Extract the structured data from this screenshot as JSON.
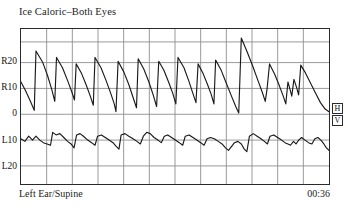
{
  "chart_title": "Ice Caloric–Both Eyes",
  "footer": {
    "condition_label": "Left Ear/Supine",
    "elapsed_time": "00:36"
  },
  "channels": {
    "horizontal_label": "H",
    "vertical_label": "V"
  },
  "colors": {
    "frame": "#2a2a2a",
    "grid": "#8d8d8d",
    "trace": "#1a1a1a",
    "background": "#ffffff"
  },
  "chart_data": {
    "type": "line",
    "title": "Ice Caloric–Both Eyes",
    "subtitle": "Left Ear/Supine",
    "xlabel": "",
    "ylabel": "Eye position (degrees)",
    "annotations": [
      "Left Ear/Supine",
      "00:36"
    ],
    "grid": true,
    "legend_position": "right-inline",
    "x": {
      "unit": "seconds",
      "range": [
        0,
        36
      ],
      "tick_count": 12,
      "tick_labels": []
    },
    "y": {
      "unit": "degrees",
      "axis_range": [
        -27,
        33
      ],
      "tick_values": [
        20,
        10,
        0,
        -10,
        -20
      ],
      "tick_labels": [
        "R20",
        "R10",
        "0",
        "L10",
        "L20"
      ],
      "direction_note": "Positive = Right, Negative = Left"
    },
    "series": [
      {
        "name": "H",
        "label": "Horizontal eye position",
        "description": "Right-beating sawtooth nystagmus; slow leftward drift with fast rightward saccade resets",
        "points": [
          [
            0.0,
            12.5
          ],
          [
            0.55,
            9.0
          ],
          [
            1.1,
            5.0
          ],
          [
            1.55,
            1.5
          ],
          [
            1.75,
            24.5
          ],
          [
            2.55,
            20.0
          ],
          [
            3.1,
            15.0
          ],
          [
            3.6,
            9.5
          ],
          [
            3.95,
            5.0
          ],
          [
            4.15,
            22.0
          ],
          [
            4.85,
            18.0
          ],
          [
            5.45,
            13.0
          ],
          [
            5.95,
            8.5
          ],
          [
            6.25,
            5.5
          ],
          [
            6.45,
            19.5
          ],
          [
            7.05,
            16.0
          ],
          [
            7.6,
            11.5
          ],
          [
            8.1,
            7.0
          ],
          [
            8.45,
            3.5
          ],
          [
            8.65,
            22.0
          ],
          [
            9.35,
            18.0
          ],
          [
            9.95,
            13.0
          ],
          [
            10.5,
            8.0
          ],
          [
            10.9,
            4.0
          ],
          [
            11.1,
            1.0
          ],
          [
            11.35,
            20.5
          ],
          [
            12.0,
            16.5
          ],
          [
            12.6,
            11.5
          ],
          [
            13.1,
            6.5
          ],
          [
            13.5,
            2.5
          ],
          [
            13.7,
            21.5
          ],
          [
            14.35,
            17.5
          ],
          [
            14.95,
            12.5
          ],
          [
            15.45,
            7.5
          ],
          [
            15.85,
            3.0
          ],
          [
            16.1,
            20.5
          ],
          [
            16.7,
            17.0
          ],
          [
            17.25,
            12.5
          ],
          [
            17.75,
            8.0
          ],
          [
            18.1,
            4.0
          ],
          [
            18.35,
            22.0
          ],
          [
            19.05,
            18.0
          ],
          [
            19.6,
            13.0
          ],
          [
            20.1,
            8.0
          ],
          [
            20.45,
            4.5
          ],
          [
            20.7,
            19.5
          ],
          [
            21.25,
            16.0
          ],
          [
            21.8,
            11.5
          ],
          [
            22.25,
            7.5
          ],
          [
            22.55,
            4.0
          ],
          [
            22.75,
            21.0
          ],
          [
            23.4,
            17.0
          ],
          [
            24.0,
            12.0
          ],
          [
            24.6,
            7.0
          ],
          [
            25.1,
            3.0
          ],
          [
            25.45,
            0.5
          ],
          [
            25.75,
            29.5
          ],
          [
            26.45,
            24.0
          ],
          [
            27.1,
            18.5
          ],
          [
            27.7,
            13.0
          ],
          [
            28.2,
            8.5
          ],
          [
            28.55,
            5.0
          ],
          [
            28.75,
            9.5
          ],
          [
            29.05,
            19.5
          ],
          [
            29.65,
            15.5
          ],
          [
            30.2,
            11.0
          ],
          [
            30.65,
            7.0
          ],
          [
            30.95,
            4.0
          ],
          [
            31.2,
            12.5
          ],
          [
            31.45,
            9.5
          ],
          [
            31.65,
            7.0
          ],
          [
            31.9,
            13.5
          ],
          [
            32.2,
            10.5
          ],
          [
            32.45,
            7.5
          ],
          [
            32.7,
            19.0
          ],
          [
            33.25,
            16.0
          ],
          [
            33.85,
            12.0
          ],
          [
            34.45,
            8.0
          ],
          [
            35.0,
            4.5
          ],
          [
            35.55,
            2.0
          ],
          [
            36.0,
            1.0
          ]
        ]
      },
      {
        "name": "V",
        "label": "Vertical eye position",
        "description": "Low-amplitude vertical trace hovering near the L10 reference line with small periodic deflections",
        "points": [
          [
            0.0,
            -9.5
          ],
          [
            0.45,
            -10.5
          ],
          [
            0.9,
            -8.5
          ],
          [
            1.35,
            -10.0
          ],
          [
            1.75,
            -8.5
          ],
          [
            2.2,
            -10.0
          ],
          [
            2.6,
            -11.0
          ],
          [
            3.05,
            -11.5
          ],
          [
            3.45,
            -12.0
          ],
          [
            3.7,
            -7.0
          ],
          [
            4.1,
            -8.0
          ],
          [
            4.55,
            -7.5
          ],
          [
            5.0,
            -9.0
          ],
          [
            5.45,
            -10.5
          ],
          [
            5.85,
            -11.5
          ],
          [
            6.2,
            -13.0
          ],
          [
            6.5,
            -8.0
          ],
          [
            6.9,
            -7.5
          ],
          [
            7.3,
            -8.5
          ],
          [
            7.8,
            -10.0
          ],
          [
            8.25,
            -11.0
          ],
          [
            8.65,
            -12.0
          ],
          [
            8.95,
            -8.5
          ],
          [
            9.4,
            -8.0
          ],
          [
            9.85,
            -9.0
          ],
          [
            10.3,
            -10.0
          ],
          [
            10.75,
            -11.0
          ],
          [
            11.15,
            -12.5
          ],
          [
            11.45,
            -13.5
          ],
          [
            11.7,
            -8.0
          ],
          [
            12.15,
            -7.5
          ],
          [
            12.6,
            -8.5
          ],
          [
            13.1,
            -9.5
          ],
          [
            13.55,
            -10.5
          ],
          [
            13.95,
            -11.5
          ],
          [
            14.3,
            -8.5
          ],
          [
            14.7,
            -7.0
          ],
          [
            15.1,
            -7.5
          ],
          [
            15.55,
            -9.0
          ],
          [
            16.0,
            -10.0
          ],
          [
            16.4,
            -11.0
          ],
          [
            16.75,
            -8.5
          ],
          [
            17.15,
            -8.0
          ],
          [
            17.6,
            -9.0
          ],
          [
            18.05,
            -10.0
          ],
          [
            18.5,
            -11.0
          ],
          [
            18.9,
            -12.0
          ],
          [
            19.2,
            -8.5
          ],
          [
            19.65,
            -8.0
          ],
          [
            20.1,
            -9.0
          ],
          [
            20.55,
            -10.0
          ],
          [
            21.0,
            -11.0
          ],
          [
            21.4,
            -12.0
          ],
          [
            21.75,
            -9.5
          ],
          [
            22.15,
            -9.0
          ],
          [
            22.6,
            -9.5
          ],
          [
            23.05,
            -10.5
          ],
          [
            23.5,
            -11.5
          ],
          [
            23.9,
            -13.0
          ],
          [
            24.25,
            -14.0
          ],
          [
            24.6,
            -12.5
          ],
          [
            24.95,
            -11.0
          ],
          [
            25.35,
            -10.5
          ],
          [
            25.75,
            -11.5
          ],
          [
            26.1,
            -13.5
          ],
          [
            26.4,
            -14.5
          ],
          [
            26.7,
            -8.5
          ],
          [
            27.15,
            -7.5
          ],
          [
            27.6,
            -8.5
          ],
          [
            28.05,
            -9.5
          ],
          [
            28.45,
            -10.5
          ],
          [
            28.8,
            -11.5
          ],
          [
            29.1,
            -8.5
          ],
          [
            29.55,
            -8.0
          ],
          [
            30.0,
            -9.0
          ],
          [
            30.45,
            -10.0
          ],
          [
            30.85,
            -11.0
          ],
          [
            31.2,
            -11.5
          ],
          [
            31.5,
            -12.0
          ],
          [
            31.85,
            -10.5
          ],
          [
            32.15,
            -11.5
          ],
          [
            32.45,
            -10.0
          ],
          [
            32.8,
            -9.0
          ],
          [
            33.2,
            -10.0
          ],
          [
            33.6,
            -11.0
          ],
          [
            34.0,
            -11.5
          ],
          [
            34.35,
            -9.5
          ],
          [
            34.7,
            -9.0
          ],
          [
            35.05,
            -10.0
          ],
          [
            35.4,
            -11.5
          ],
          [
            35.7,
            -13.0
          ],
          [
            36.0,
            -14.0
          ]
        ]
      }
    ]
  }
}
